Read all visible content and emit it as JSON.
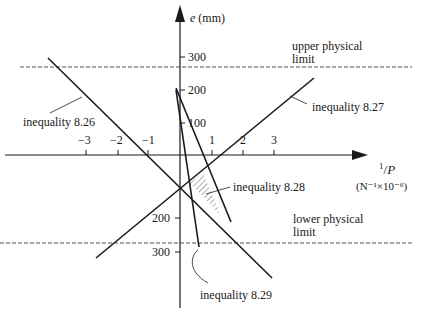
{
  "diagram": {
    "y_axis_label_var": "e",
    "y_axis_label_unit": "(mm)",
    "x_axis_label_num": "1",
    "x_axis_label_den": "P",
    "x_axis_unit": "(N⁻¹×10⁻⁶)",
    "x_ticks": [
      {
        "label": "−3",
        "value": -3
      },
      {
        "label": "−2",
        "value": -2
      },
      {
        "label": "−1",
        "value": -1
      },
      {
        "label": "1",
        "value": 1
      },
      {
        "label": "2",
        "value": 2
      },
      {
        "label": "3",
        "value": 3
      }
    ],
    "y_ticks_upper": [
      {
        "label": "300",
        "value": 300
      },
      {
        "label": "200",
        "value": 200
      },
      {
        "label": "100",
        "value": 100
      }
    ],
    "y_ticks_lower": [
      {
        "label": "200",
        "value": -200
      },
      {
        "label": "300",
        "value": -300
      }
    ],
    "upper_limit_line1": "upper physical",
    "upper_limit_line2": "limit",
    "lower_limit_line1": "lower physical",
    "lower_limit_line2": "limit",
    "labels": {
      "ineq_826": "inequality 8.26",
      "ineq_827": "inequality 8.27",
      "ineq_828": "inequality 8.28",
      "ineq_829": "inequality 8.29"
    },
    "line_color": "#1a1a1a",
    "dash_color": "#555555"
  }
}
